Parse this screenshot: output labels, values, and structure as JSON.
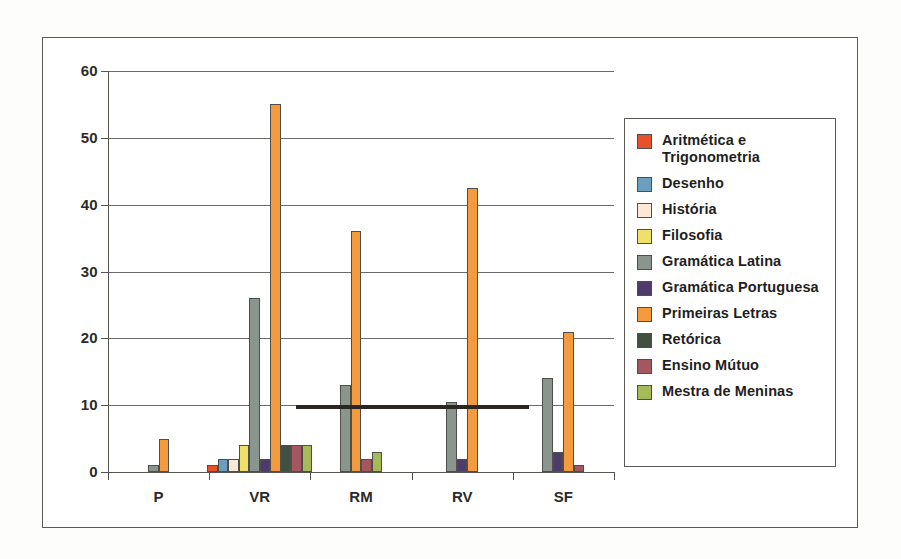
{
  "chart_data": {
    "type": "bar",
    "title": "",
    "subtitle": "",
    "xlabel": "",
    "ylabel": "",
    "ylim": [
      0,
      60
    ],
    "ytick_step": 10,
    "yticks": [
      "0",
      "10",
      "20",
      "30",
      "40",
      "50",
      "60"
    ],
    "grid": true,
    "legend_position": "right",
    "categories": [
      "P",
      "VR",
      "RM",
      "RV",
      "SF"
    ],
    "series": [
      {
        "name": "Aritmética e Trigonometria",
        "color": "#e8512c",
        "values": [
          0,
          1,
          0,
          0,
          0
        ]
      },
      {
        "name": "Desenho",
        "color": "#6b9fbd",
        "values": [
          0,
          2,
          0,
          0,
          0
        ]
      },
      {
        "name": "História",
        "color": "#fbe8d5",
        "values": [
          0,
          2,
          0,
          0,
          0
        ]
      },
      {
        "name": "Filosofia",
        "color": "#eee06a",
        "values": [
          0,
          4,
          0,
          0,
          0
        ]
      },
      {
        "name": "Gramática Latina",
        "color": "#8a968d",
        "values": [
          1,
          26,
          13,
          10.5,
          14
        ]
      },
      {
        "name": "Gramática Portuguesa",
        "color": "#4e3b6b",
        "values": [
          0,
          2,
          0,
          2,
          3
        ]
      },
      {
        "name": "Primeiras Letras",
        "color": "#f49b3f",
        "values": [
          5,
          55,
          36,
          42.5,
          21
        ]
      },
      {
        "name": "Retórica",
        "color": "#415141",
        "values": [
          0,
          4,
          0,
          0,
          0
        ]
      },
      {
        "name": "Ensino Mútuo",
        "color": "#a4575e",
        "values": [
          0,
          4,
          2,
          0,
          1
        ]
      },
      {
        "name": "Mestra de Meninas",
        "color": "#a5bb5a",
        "values": [
          0,
          4,
          3,
          0,
          0
        ]
      }
    ]
  },
  "legend": {
    "items": [
      {
        "label": "Aritmética e Trigonometria"
      },
      {
        "label": "Desenho"
      },
      {
        "label": "História"
      },
      {
        "label": "Filosofia"
      },
      {
        "label": "Gramática Latina"
      },
      {
        "label": "Gramática Portuguesa"
      },
      {
        "label": "Primeiras Letras"
      },
      {
        "label": "Retórica"
      },
      {
        "label": "Ensino Mútuo"
      },
      {
        "label": "Mestra de Meninas"
      }
    ]
  }
}
